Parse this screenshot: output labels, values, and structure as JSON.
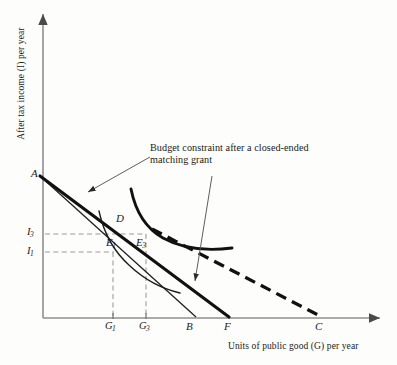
{
  "figure": {
    "type": "economics-indifference-curve-diagram",
    "annotation": {
      "line1": "Budget constraint after a closed-ended",
      "line2": "matching grant"
    },
    "axes": {
      "y_title": "After tax income (I) per year",
      "x_title": "Units of public good (G) per year",
      "y_ticks": [
        {
          "base": "I",
          "sub": "3"
        },
        {
          "base": "I",
          "sub": "1"
        }
      ],
      "x_ticks": [
        {
          "base": "G",
          "sub": "1"
        },
        {
          "base": "G",
          "sub": "3"
        }
      ]
    },
    "points": [
      {
        "id": "A",
        "base": "A",
        "sub": ""
      },
      {
        "id": "D",
        "base": "D",
        "sub": ""
      },
      {
        "id": "E1",
        "base": "E",
        "sub": "1"
      },
      {
        "id": "E3",
        "base": "E",
        "sub": "3"
      },
      {
        "id": "B",
        "base": "B",
        "sub": ""
      },
      {
        "id": "F",
        "base": "F",
        "sub": ""
      },
      {
        "id": "C",
        "base": "C",
        "sub": ""
      }
    ],
    "colors": {
      "ink": "#1a1a1a",
      "axis": "#8a8a8a",
      "guide": "#9a9a9a",
      "background": "#fdfdfc"
    }
  }
}
